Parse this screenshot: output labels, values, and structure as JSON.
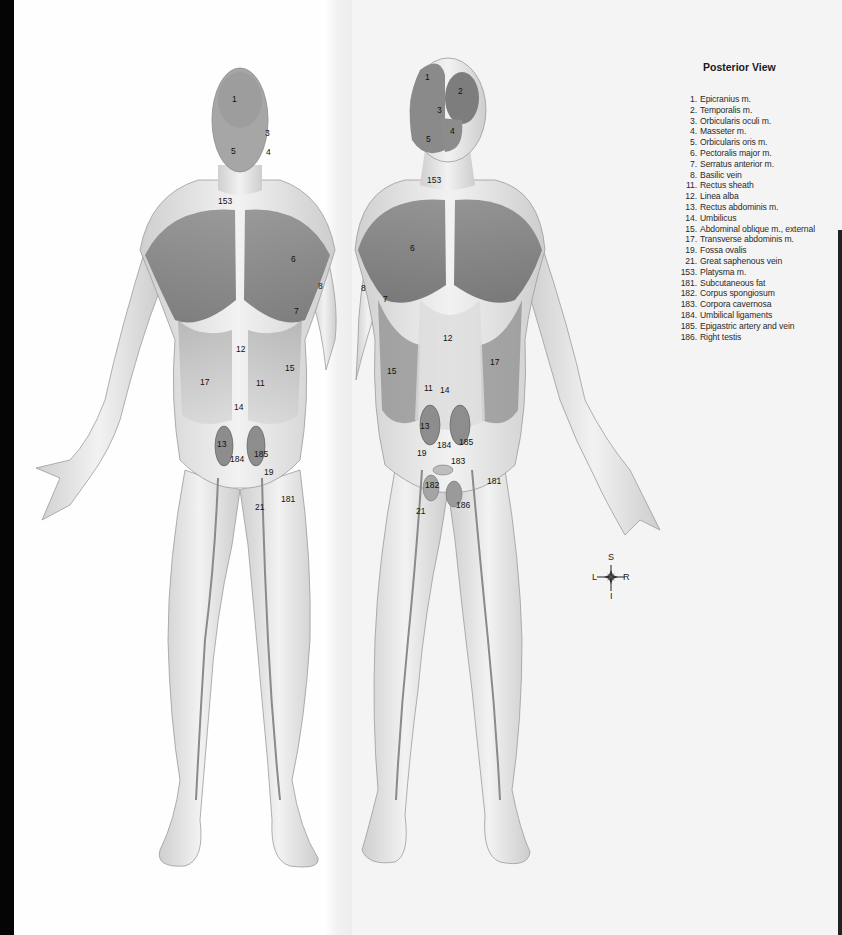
{
  "legend": {
    "title": "Posterior View",
    "items": [
      {
        "num": "1.",
        "name": "Epicranius m."
      },
      {
        "num": "2.",
        "name": "Temporalis m."
      },
      {
        "num": "3.",
        "name": "Orbicularis oculi m."
      },
      {
        "num": "4.",
        "name": "Masseter m."
      },
      {
        "num": "5.",
        "name": "Orbicularis oris m."
      },
      {
        "num": "6.",
        "name": "Pectoralis major m."
      },
      {
        "num": "7.",
        "name": "Serratus anterior m."
      },
      {
        "num": "8.",
        "name": "Basilic vein"
      },
      {
        "num": "11.",
        "name": "Rectus sheath"
      },
      {
        "num": "12.",
        "name": "Linea alba"
      },
      {
        "num": "13.",
        "name": "Rectus abdominis m."
      },
      {
        "num": "14.",
        "name": "Umbilicus"
      },
      {
        "num": "15.",
        "name": "Abdominal oblique m., external"
      },
      {
        "num": "17.",
        "name": "Transverse abdominis m."
      },
      {
        "num": "19.",
        "name": "Fossa ovalis"
      },
      {
        "num": "21.",
        "name": "Great saphenous vein"
      },
      {
        "num": "153.",
        "name": "Platysma m."
      },
      {
        "num": "181.",
        "name": "Subcutaneous fat"
      },
      {
        "num": "182.",
        "name": "Corpus spongiosum"
      },
      {
        "num": "183.",
        "name": "Corpora cavernosa"
      },
      {
        "num": "184.",
        "name": "Umbilical ligaments"
      },
      {
        "num": "185.",
        "name": "Epigastric artery and vein"
      },
      {
        "num": "186.",
        "name": "Right testis"
      }
    ]
  },
  "compass": {
    "superior": "S",
    "inferior": "I",
    "left": "L",
    "right": "R"
  },
  "figure_front_female": {
    "labels": [
      {
        "text": "1",
        "x": 232,
        "y": 102
      },
      {
        "text": "3",
        "x": 265,
        "y": 136
      },
      {
        "text": "5",
        "x": 233,
        "y": 153
      },
      {
        "text": "4",
        "x": 268,
        "y": 154
      },
      {
        "text": "153",
        "x": 224,
        "y": 204
      },
      {
        "text": "6",
        "x": 293,
        "y": 262
      },
      {
        "text": "8",
        "x": 320,
        "y": 289
      },
      {
        "text": "7",
        "x": 296,
        "y": 314
      },
      {
        "text": "12",
        "x": 240,
        "y": 352
      },
      {
        "text": "15",
        "x": 289,
        "y": 371
      },
      {
        "text": "17",
        "x": 204,
        "y": 385
      },
      {
        "text": "11",
        "x": 260,
        "y": 386
      },
      {
        "text": "14",
        "x": 238,
        "y": 410
      },
      {
        "text": "13",
        "x": 221,
        "y": 447
      },
      {
        "text": "185",
        "x": 260,
        "y": 457
      },
      {
        "text": "184",
        "x": 236,
        "y": 462
      },
      {
        "text": "19",
        "x": 268,
        "y": 475
      },
      {
        "text": "181",
        "x": 287,
        "y": 502
      },
      {
        "text": "21",
        "x": 259,
        "y": 510
      }
    ]
  },
  "figure_front_male": {
    "labels": [
      {
        "text": "1",
        "x": 427,
        "y": 80
      },
      {
        "text": "2",
        "x": 460,
        "y": 94
      },
      {
        "text": "3",
        "x": 439,
        "y": 113
      },
      {
        "text": "4",
        "x": 452,
        "y": 134
      },
      {
        "text": "5",
        "x": 428,
        "y": 142
      },
      {
        "text": "153",
        "x": 433,
        "y": 183
      },
      {
        "text": "6",
        "x": 412,
        "y": 251
      },
      {
        "text": "8",
        "x": 363,
        "y": 291
      },
      {
        "text": "7",
        "x": 385,
        "y": 302
      },
      {
        "text": "12",
        "x": 447,
        "y": 341
      },
      {
        "text": "17",
        "x": 494,
        "y": 365
      },
      {
        "text": "15",
        "x": 391,
        "y": 374
      },
      {
        "text": "11",
        "x": 428,
        "y": 391
      },
      {
        "text": "14",
        "x": 444,
        "y": 393
      },
      {
        "text": "13",
        "x": 424,
        "y": 429
      },
      {
        "text": "184",
        "x": 443,
        "y": 448
      },
      {
        "text": "185",
        "x": 465,
        "y": 445
      },
      {
        "text": "19",
        "x": 421,
        "y": 456
      },
      {
        "text": "183",
        "x": 457,
        "y": 464
      },
      {
        "text": "181",
        "x": 493,
        "y": 484
      },
      {
        "text": "182",
        "x": 431,
        "y": 488
      },
      {
        "text": "186",
        "x": 462,
        "y": 508
      },
      {
        "text": "21",
        "x": 420,
        "y": 514
      }
    ]
  }
}
